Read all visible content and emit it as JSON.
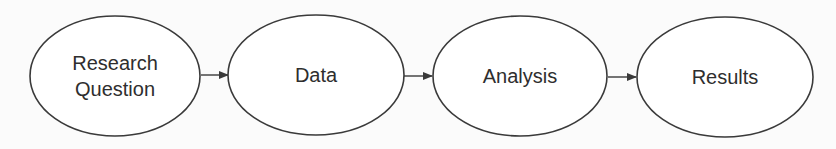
{
  "diagram": {
    "type": "flowchart",
    "direction": "left-to-right",
    "nodes": [
      {
        "id": "research-question",
        "shape": "ellipse",
        "line1": "Research",
        "line2": "Question"
      },
      {
        "id": "data",
        "shape": "ellipse",
        "label": "Data"
      },
      {
        "id": "analysis",
        "shape": "ellipse",
        "label": "Analysis"
      },
      {
        "id": "results",
        "shape": "ellipse",
        "label": "Results"
      }
    ],
    "edges": [
      {
        "from": "research-question",
        "to": "data"
      },
      {
        "from": "data",
        "to": "analysis"
      },
      {
        "from": "analysis",
        "to": "results"
      }
    ],
    "colors": {
      "stroke": "#3a3a3a",
      "text": "#2e2e2e",
      "fill": "#ffffff",
      "background": "#fbfbfb"
    }
  }
}
